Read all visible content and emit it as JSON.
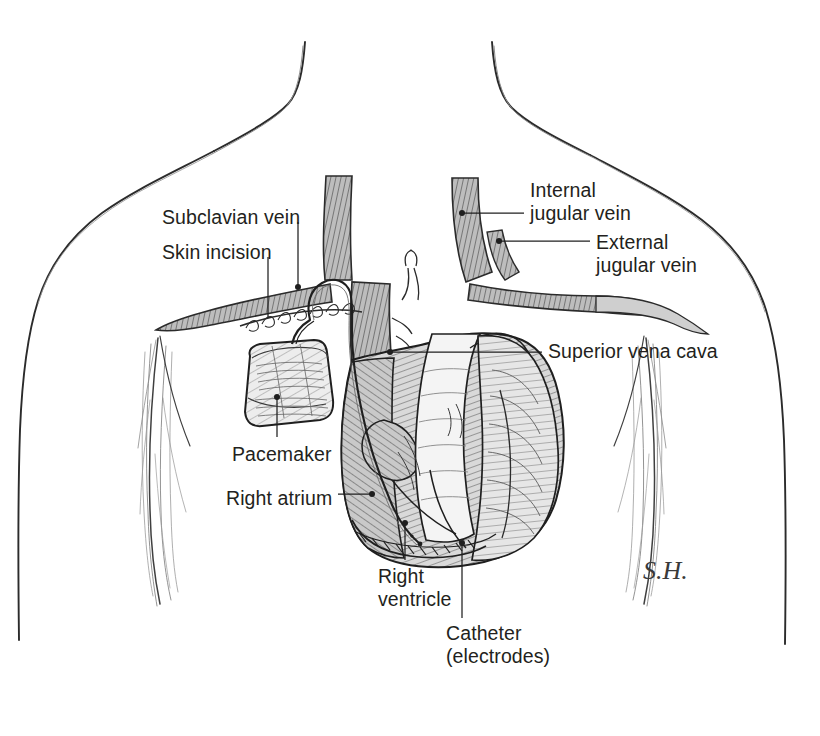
{
  "figure": {
    "medium": "pen-and-ink line drawing",
    "signature": "S.H.",
    "ink_color": "#231f20",
    "vessel_fill": "#b9b9b9",
    "heart_fill": "#d8d8d8",
    "device_fill": "#c6c6c6",
    "background": "#ffffff"
  },
  "labels": [
    {
      "id": "subclavian-vein",
      "text": "Subclavian vein",
      "x": 162,
      "y": 206,
      "align": "left"
    },
    {
      "id": "skin-incision",
      "text": "Skin incision",
      "x": 162,
      "y": 241,
      "align": "left"
    },
    {
      "id": "internal-jugular",
      "text": "Internal\njugular vein",
      "x": 530,
      "y": 179,
      "align": "left"
    },
    {
      "id": "external-jugular",
      "text": "External\njugular vein",
      "x": 596,
      "y": 231,
      "align": "left"
    },
    {
      "id": "superior-vena-cava",
      "text": "Superior vena cava",
      "x": 548,
      "y": 340,
      "align": "left"
    },
    {
      "id": "pacemaker",
      "text": "Pacemaker",
      "x": 232,
      "y": 443,
      "align": "left"
    },
    {
      "id": "right-atrium",
      "text": "Right atrium",
      "x": 226,
      "y": 487,
      "align": "left"
    },
    {
      "id": "right-ventricle",
      "text": "Right\nventricle",
      "x": 378,
      "y": 565,
      "align": "left"
    },
    {
      "id": "catheter",
      "text": "Catheter\n(electrodes)",
      "x": 446,
      "y": 622,
      "align": "left"
    }
  ],
  "anatomy": [
    {
      "id": "neck-left",
      "name": "left neck contour"
    },
    {
      "id": "neck-right",
      "name": "right neck contour"
    },
    {
      "id": "shoulder-left",
      "name": "left shoulder and torso"
    },
    {
      "id": "shoulder-right",
      "name": "right shoulder and torso"
    },
    {
      "id": "axilla-left",
      "name": "left axillary fold hatching"
    },
    {
      "id": "axilla-right",
      "name": "right axillary fold hatching"
    },
    {
      "id": "internal-jugular-vessel",
      "name": "internal jugular vein"
    },
    {
      "id": "external-jugular-vessel",
      "name": "external jugular vein"
    },
    {
      "id": "subclavian-vessel",
      "name": "subclavian vein"
    },
    {
      "id": "innominate-vessel",
      "name": "brachiocephalic vein"
    },
    {
      "id": "svc-vessel",
      "name": "superior vena cava"
    },
    {
      "id": "heart",
      "name": "heart"
    },
    {
      "id": "right-atrium-body",
      "name": "right atrium"
    },
    {
      "id": "right-ventricle-body",
      "name": "right ventricle"
    },
    {
      "id": "aorta",
      "name": "aortic arch"
    },
    {
      "id": "pacemaker-device",
      "name": "pulse generator"
    },
    {
      "id": "incision-sutures",
      "name": "sutured skin incision"
    },
    {
      "id": "catheter-lead",
      "name": "pacing catheter lead"
    }
  ]
}
